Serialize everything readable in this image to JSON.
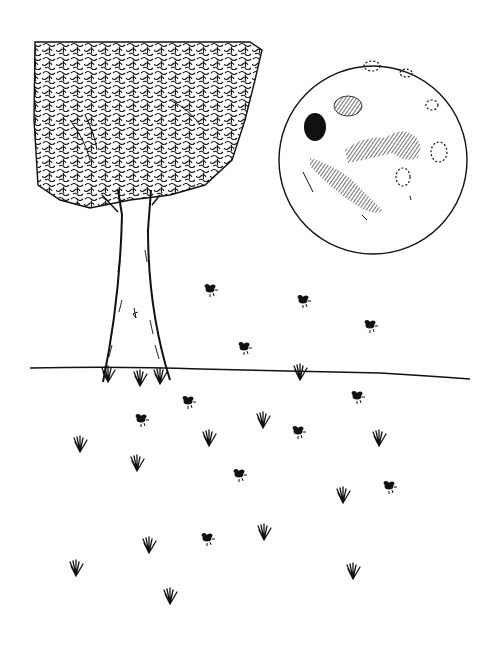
{
  "illustration": {
    "title": "Fireflies under the moon",
    "style": "pen-and-ink line drawing",
    "colors": {
      "ink": "#111111",
      "paper": "#ffffff"
    },
    "elements": {
      "tree": {
        "canopy": "dense scribbled leaf canopy",
        "trunk": "tapered trunk with hatching"
      },
      "moon": {
        "cx": 373,
        "cy": 160,
        "r": 94,
        "features": "hatched maria and dotted craters"
      },
      "horizon": {
        "y": 370
      },
      "fireflies": [
        {
          "x": 210,
          "y": 289
        },
        {
          "x": 303,
          "y": 300
        },
        {
          "x": 370,
          "y": 325
        },
        {
          "x": 244,
          "y": 347
        },
        {
          "x": 188,
          "y": 401
        },
        {
          "x": 357,
          "y": 396
        },
        {
          "x": 141,
          "y": 419
        },
        {
          "x": 298,
          "y": 431
        },
        {
          "x": 239,
          "y": 474
        },
        {
          "x": 389,
          "y": 486
        },
        {
          "x": 207,
          "y": 538
        }
      ],
      "grass_tufts": [
        {
          "x": 300,
          "y": 372
        },
        {
          "x": 80,
          "y": 444
        },
        {
          "x": 209,
          "y": 436
        },
        {
          "x": 263,
          "y": 418
        },
        {
          "x": 379,
          "y": 437
        },
        {
          "x": 137,
          "y": 463
        },
        {
          "x": 343,
          "y": 493
        },
        {
          "x": 149,
          "y": 543
        },
        {
          "x": 264,
          "y": 530
        },
        {
          "x": 76,
          "y": 566
        },
        {
          "x": 353,
          "y": 565
        },
        {
          "x": 170,
          "y": 594
        },
        {
          "x": 108,
          "y": 378
        },
        {
          "x": 140,
          "y": 382
        },
        {
          "x": 160,
          "y": 380
        }
      ]
    }
  }
}
